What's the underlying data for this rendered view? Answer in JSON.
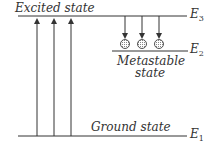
{
  "diagram": {
    "levels": [
      {
        "id": "E3",
        "name": "E",
        "sub": "3",
        "label": "Excited state"
      },
      {
        "id": "E2",
        "name": "E",
        "sub": "2",
        "label_line1": "Metastable",
        "label_line2": "state"
      },
      {
        "id": "E1",
        "name": "E",
        "sub": "1",
        "label": "Ground state"
      }
    ],
    "upward_arrows": 3,
    "downward_arrows": 3,
    "particles": 3,
    "colors": {
      "line": "#333333",
      "particle_fill": "#cccccc"
    }
  }
}
